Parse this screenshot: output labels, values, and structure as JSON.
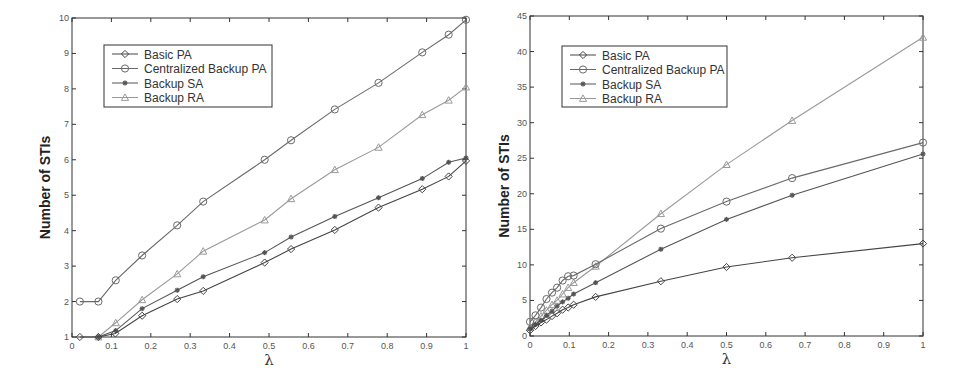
{
  "chart_data": [
    {
      "type": "line",
      "title": "",
      "xlabel": "λ",
      "ylabel": "Number of STIs",
      "xlim": [
        0,
        1
      ],
      "ylim": [
        1,
        10
      ],
      "xticks": [
        "0",
        "0.1",
        "0.2",
        "0.3",
        "0.4",
        "0.5",
        "0.6",
        "0.7",
        "0.8",
        "0.9",
        "1"
      ],
      "yticks": [
        "1",
        "2",
        "3",
        "4",
        "5",
        "6",
        "7",
        "8",
        "9",
        "10"
      ],
      "grid": false,
      "legend_position": "upper left",
      "series": [
        {
          "name": "Basic PA",
          "marker": "diamond",
          "color": "#444444",
          "x": [
            0.02,
            0.067,
            0.11,
            0.178,
            0.267,
            0.333,
            0.489,
            0.556,
            0.667,
            0.778,
            0.889,
            0.956,
            1.0
          ],
          "y": [
            1.0,
            1.0,
            1.1,
            1.6,
            2.07,
            2.3,
            3.1,
            3.48,
            4.02,
            4.65,
            5.17,
            5.53,
            5.97
          ]
        },
        {
          "name": "Centralized Backup PA",
          "marker": "circle",
          "color": "#6a6a6a",
          "x": [
            0.02,
            0.067,
            0.111,
            0.178,
            0.267,
            0.333,
            0.489,
            0.556,
            0.667,
            0.778,
            0.889,
            0.956,
            1.0
          ],
          "y": [
            2.0,
            2.0,
            2.6,
            3.3,
            4.15,
            4.82,
            6.0,
            6.55,
            7.42,
            8.17,
            9.03,
            9.53,
            9.95
          ]
        },
        {
          "name": "Backup SA",
          "marker": "star",
          "color": "#555555",
          "x": [
            0.067,
            0.111,
            0.178,
            0.267,
            0.333,
            0.489,
            0.556,
            0.667,
            0.778,
            0.889,
            0.956,
            1.0
          ],
          "y": [
            1.0,
            1.18,
            1.8,
            2.32,
            2.7,
            3.38,
            3.82,
            4.4,
            4.93,
            5.47,
            5.93,
            6.05
          ]
        },
        {
          "name": "Backup RA",
          "marker": "triangle",
          "color": "#9a9a9a",
          "x": [
            0.067,
            0.111,
            0.178,
            0.267,
            0.333,
            0.489,
            0.556,
            0.667,
            0.778,
            0.889,
            0.956,
            1.0
          ],
          "y": [
            1.0,
            1.4,
            2.05,
            2.78,
            3.42,
            4.3,
            4.9,
            5.72,
            6.35,
            7.27,
            7.68,
            8.05
          ]
        }
      ]
    },
    {
      "type": "line",
      "title": "",
      "xlabel": "λ",
      "ylabel": "Number of STIs",
      "xlim": [
        0,
        1
      ],
      "ylim": [
        0,
        45
      ],
      "xticks": [
        "0",
        "0.1",
        "0.2",
        "0.3",
        "0.4",
        "0.5",
        "0.6",
        "0.7",
        "0.8",
        "0.9",
        "1"
      ],
      "yticks": [
        "0",
        "5",
        "10",
        "15",
        "20",
        "25",
        "30",
        "35",
        "40",
        "45"
      ],
      "grid": false,
      "legend_position": "upper left",
      "series": [
        {
          "name": "Basic PA",
          "marker": "diamond",
          "color": "#444444",
          "x": [
            0,
            0.014,
            0.028,
            0.042,
            0.056,
            0.069,
            0.083,
            0.097,
            0.111,
            0.167,
            0.333,
            0.5,
            0.667,
            1.0
          ],
          "y": [
            0.8,
            1.4,
            1.9,
            2.3,
            2.8,
            3.2,
            3.7,
            4.0,
            4.4,
            5.5,
            7.7,
            9.7,
            11.0,
            13.0
          ]
        },
        {
          "name": "Centralized Backup PA",
          "marker": "circle",
          "color": "#6a6a6a",
          "x": [
            0,
            0.014,
            0.028,
            0.042,
            0.056,
            0.069,
            0.083,
            0.097,
            0.111,
            0.167,
            0.333,
            0.5,
            0.667,
            1.0
          ],
          "y": [
            2.0,
            2.9,
            4.0,
            5.2,
            6.1,
            6.8,
            7.8,
            8.4,
            8.5,
            10.1,
            15.1,
            18.9,
            22.2,
            27.2
          ]
        },
        {
          "name": "Backup SA",
          "marker": "star",
          "color": "#555555",
          "x": [
            0,
            0.014,
            0.028,
            0.042,
            0.056,
            0.069,
            0.083,
            0.097,
            0.111,
            0.167,
            0.333,
            0.5,
            0.667,
            1.0
          ],
          "y": [
            1.0,
            1.6,
            2.2,
            2.9,
            3.5,
            4.2,
            4.8,
            5.3,
            5.9,
            7.5,
            12.2,
            16.4,
            19.8,
            25.6
          ]
        },
        {
          "name": "Backup RA",
          "marker": "triangle",
          "color": "#9a9a9a",
          "x": [
            0,
            0.014,
            0.028,
            0.042,
            0.056,
            0.069,
            0.083,
            0.097,
            0.111,
            0.167,
            0.333,
            0.5,
            0.667,
            1.0
          ],
          "y": [
            1.2,
            2.0,
            2.8,
            3.6,
            4.4,
            5.0,
            5.9,
            6.8,
            7.5,
            9.8,
            17.2,
            24.1,
            30.3,
            42.0
          ]
        }
      ]
    }
  ],
  "layout": {
    "charts": [
      {
        "plot": {
          "x0": 72,
          "x1": 466,
          "y0": 337,
          "y1": 18
        },
        "legend": {
          "x": 104,
          "y": 45,
          "w": 168,
          "h": 62
        },
        "ylabel_x": 50
      },
      {
        "plot": {
          "x0": 530,
          "x1": 923,
          "y0": 336,
          "y1": 16
        },
        "legend": {
          "x": 562,
          "y": 46,
          "w": 165,
          "h": 61
        },
        "ylabel_x": 509
      }
    ]
  }
}
